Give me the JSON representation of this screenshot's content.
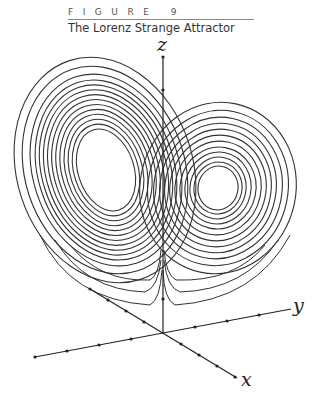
{
  "figure": {
    "label": "FIGURE 9",
    "title": "The Lorenz Strange Attractor"
  },
  "axes": {
    "x": "x",
    "y": "y",
    "z": "z"
  }
}
